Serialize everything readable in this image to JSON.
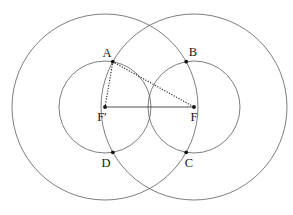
{
  "labels": {
    "a": "A",
    "b": "B",
    "c": "C",
    "d": "D",
    "f_prime": "F′",
    "f": "F"
  },
  "colors": {
    "background": "#ffffff",
    "circle_stroke": "#5d5d5d",
    "segment_stroke": "#3b3b3b",
    "dotted_stroke": "#262626",
    "point_fill": "#141414",
    "label_fill": "#161616"
  }
}
